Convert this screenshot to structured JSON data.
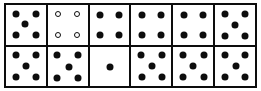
{
  "figure": {
    "kind": "pip-grid",
    "columns": 6,
    "rows": 2,
    "colors": {
      "border": "#0d0d0d",
      "pip_filled": "#0d0d0d",
      "pip_hollow_fill": "#ffffff",
      "pip_hollow_stroke": "#0d0d0d",
      "cell_background": "#ffffff",
      "page_background": "#ffffff"
    }
  },
  "chart_data": {
    "type": "table",
    "title": "",
    "xlabel": "",
    "ylabel": "",
    "categories": [
      "1",
      "2",
      "3",
      "4",
      "5",
      "6"
    ],
    "series": [
      {
        "name": "top",
        "values": [
          5,
          4,
          4,
          4,
          4,
          5
        ]
      },
      {
        "name": "bottom",
        "values": [
          5,
          5,
          1,
          5,
          5,
          5
        ]
      }
    ]
  },
  "cells": {
    "top": [
      {
        "id": "top-1",
        "count": 5,
        "style": "filled",
        "pips": [
          {
            "x": 24,
            "y": 24
          },
          {
            "x": 76,
            "y": 24
          },
          {
            "x": 47,
            "y": 47
          },
          {
            "x": 24,
            "y": 76
          },
          {
            "x": 76,
            "y": 76
          }
        ]
      },
      {
        "id": "top-2",
        "count": 4,
        "style": "hollow",
        "pips": [
          {
            "x": 26,
            "y": 24
          },
          {
            "x": 74,
            "y": 24
          },
          {
            "x": 26,
            "y": 76
          },
          {
            "x": 74,
            "y": 76
          }
        ]
      },
      {
        "id": "top-3",
        "count": 4,
        "style": "filled",
        "pips": [
          {
            "x": 26,
            "y": 26
          },
          {
            "x": 74,
            "y": 26
          },
          {
            "x": 26,
            "y": 76
          },
          {
            "x": 74,
            "y": 76
          }
        ]
      },
      {
        "id": "top-4",
        "count": 4,
        "style": "filled",
        "pips": [
          {
            "x": 26,
            "y": 26
          },
          {
            "x": 74,
            "y": 26
          },
          {
            "x": 26,
            "y": 76
          },
          {
            "x": 74,
            "y": 76
          }
        ]
      },
      {
        "id": "top-5",
        "count": 4,
        "style": "filled",
        "pips": [
          {
            "x": 26,
            "y": 26
          },
          {
            "x": 74,
            "y": 26
          },
          {
            "x": 26,
            "y": 76
          },
          {
            "x": 74,
            "y": 76
          }
        ]
      },
      {
        "id": "top-6",
        "count": 5,
        "style": "filled",
        "pips": [
          {
            "x": 24,
            "y": 24
          },
          {
            "x": 76,
            "y": 24
          },
          {
            "x": 50,
            "y": 50
          },
          {
            "x": 24,
            "y": 78
          },
          {
            "x": 76,
            "y": 78
          }
        ]
      }
    ],
    "bottom": [
      {
        "id": "bottom-1",
        "count": 5,
        "style": "filled",
        "pips": [
          {
            "x": 24,
            "y": 22
          },
          {
            "x": 76,
            "y": 22
          },
          {
            "x": 50,
            "y": 50
          },
          {
            "x": 24,
            "y": 78
          },
          {
            "x": 76,
            "y": 78
          }
        ]
      },
      {
        "id": "bottom-2",
        "count": 5,
        "style": "filled",
        "pips": [
          {
            "x": 24,
            "y": 22
          },
          {
            "x": 76,
            "y": 22
          },
          {
            "x": 52,
            "y": 52
          },
          {
            "x": 24,
            "y": 80
          },
          {
            "x": 76,
            "y": 80
          }
        ]
      },
      {
        "id": "bottom-3",
        "count": 1,
        "style": "filled",
        "pips": [
          {
            "x": 50,
            "y": 52
          }
        ]
      },
      {
        "id": "bottom-4",
        "count": 5,
        "style": "filled",
        "pips": [
          {
            "x": 24,
            "y": 22
          },
          {
            "x": 76,
            "y": 22
          },
          {
            "x": 52,
            "y": 50
          },
          {
            "x": 26,
            "y": 78
          },
          {
            "x": 76,
            "y": 78
          }
        ]
      },
      {
        "id": "bottom-5",
        "count": 5,
        "style": "filled",
        "pips": [
          {
            "x": 24,
            "y": 22
          },
          {
            "x": 76,
            "y": 22
          },
          {
            "x": 50,
            "y": 50
          },
          {
            "x": 24,
            "y": 78
          },
          {
            "x": 76,
            "y": 78
          }
        ]
      },
      {
        "id": "bottom-6",
        "count": 5,
        "style": "filled",
        "pips": [
          {
            "x": 24,
            "y": 22
          },
          {
            "x": 76,
            "y": 22
          },
          {
            "x": 52,
            "y": 50
          },
          {
            "x": 24,
            "y": 78
          },
          {
            "x": 76,
            "y": 78
          }
        ]
      }
    ]
  }
}
